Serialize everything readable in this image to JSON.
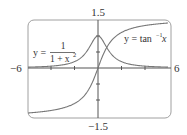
{
  "chart_data": {
    "type": "line",
    "title": "",
    "xlabel": "",
    "ylabel": "",
    "xlim": [
      -6,
      6
    ],
    "ylim": [
      -1.5,
      1.5
    ],
    "x_tick_labels": [
      "-6",
      "6"
    ],
    "y_tick_labels": [
      "1.5",
      "-1.5"
    ],
    "x_ticks": [
      -6,
      -4,
      -2,
      0,
      2,
      4,
      6
    ],
    "y_ticks": [
      -1,
      -0.5,
      0,
      0.5,
      1
    ],
    "grid": false,
    "legend": "none",
    "series": [
      {
        "name": "y = 1/(1 + x^2)",
        "function": "1/(1+x^2)",
        "x": [
          -6,
          -5,
          -4,
          -3,
          -2,
          -1.5,
          -1,
          -0.5,
          0,
          0.5,
          1,
          1.5,
          2,
          3,
          4,
          5,
          6
        ],
        "values": [
          0.027,
          0.038,
          0.059,
          0.1,
          0.2,
          0.308,
          0.5,
          0.8,
          1.0,
          0.8,
          0.5,
          0.308,
          0.2,
          0.1,
          0.059,
          0.038,
          0.027
        ]
      },
      {
        "name": "y = tan^-1 x",
        "function": "atan(x)",
        "x": [
          -6,
          -5,
          -4,
          -3,
          -2,
          -1.5,
          -1,
          -0.5,
          0,
          0.5,
          1,
          1.5,
          2,
          3,
          4,
          5,
          6
        ],
        "values": [
          -1.406,
          -1.373,
          -1.326,
          -1.249,
          -1.107,
          -0.983,
          -0.785,
          -0.464,
          0,
          0.464,
          0.785,
          0.983,
          1.107,
          1.249,
          1.326,
          1.373,
          1.406
        ]
      }
    ],
    "annotations": [
      {
        "text": "y = 1/(1 + x^2)",
        "position": "left, above x-axis"
      },
      {
        "text": "y = tan^-1 x",
        "position": "upper right"
      }
    ]
  },
  "labels": {
    "xmin": "−6",
    "xmax": "6",
    "ymax": "1.5",
    "ymin": "−1.5",
    "curve1": {
      "y_eq": "y =",
      "numerator": "1",
      "denominator": "1 + x",
      "exponent": "2"
    },
    "curve2": {
      "y_eq": "y = tan",
      "exponent": "−1",
      "var": "x"
    }
  },
  "colors": {
    "axis": "#555555",
    "curve": "#777777",
    "frame": "#999999",
    "text": "#333333"
  }
}
